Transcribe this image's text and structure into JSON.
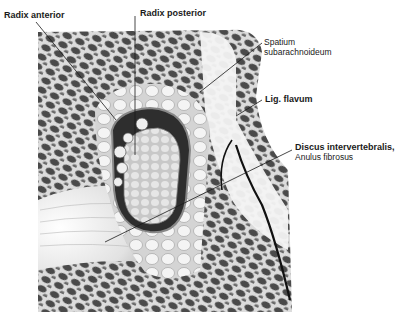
{
  "figure": {
    "colors": {
      "background": "#ffffff",
      "bone_dark": "#3a3a3a",
      "bone_light": "#bdbdbd",
      "tissue": "#e8e8e8",
      "disc": "#f2f2f2",
      "leader_line": "#1a1a1a"
    }
  },
  "labels": {
    "radix_anterior": "Radix anterior",
    "radix_posterior": "Radix posterior",
    "spatium_line1": "Spatium",
    "spatium_line2": "subarachnoideum",
    "lig_flavum": "Lig. flavum",
    "discus_line1": "Discus intervertebralis,",
    "discus_line2": "Anulus fibrosus"
  }
}
